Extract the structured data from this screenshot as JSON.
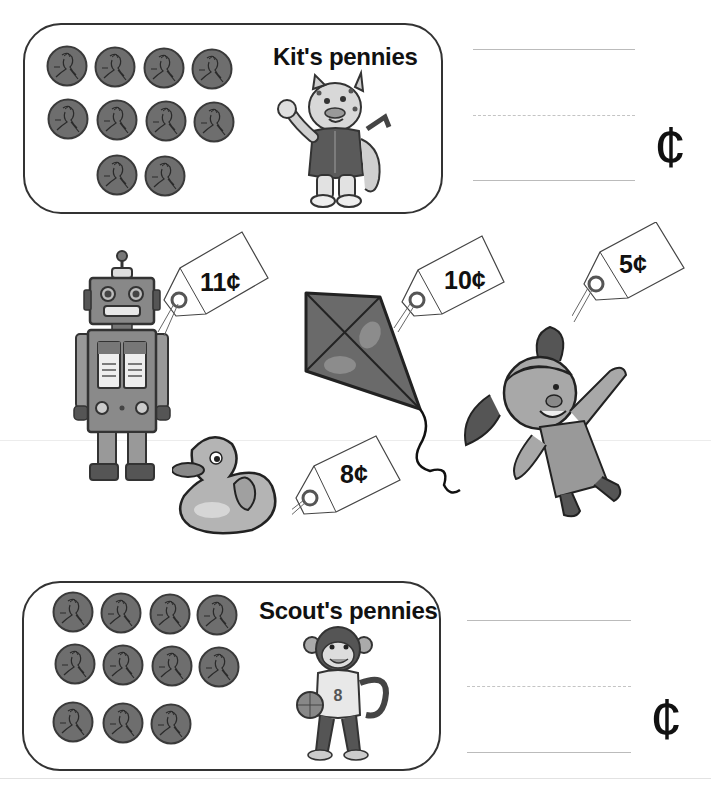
{
  "worksheet": {
    "kit_box": {
      "title": "Kit's pennies",
      "penny_count": 10,
      "character": "leopard-mascot",
      "answer_unit": "¢"
    },
    "scout_box": {
      "title": "Scout's pennies",
      "penny_count": 11,
      "character": "monkey-mascot",
      "jersey_number": "8",
      "answer_unit": "¢"
    },
    "toys": [
      {
        "name": "robot",
        "price": "11¢"
      },
      {
        "name": "kite",
        "price": "10¢"
      },
      {
        "name": "doll",
        "price": "5¢"
      },
      {
        "name": "rubber-duck",
        "price": "8¢"
      }
    ]
  },
  "colors": {
    "coin_fill": "#6e6e6e",
    "coin_edge": "#3a3a3a",
    "border": "#333333",
    "writing_line": "#bbbbbb"
  }
}
